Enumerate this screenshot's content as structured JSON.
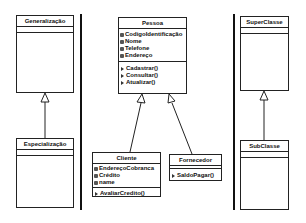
{
  "panels": {
    "left": {
      "parent": {
        "name": "Generalização",
        "attributes": [],
        "operations": []
      },
      "child": {
        "name": "Especialização",
        "attributes": [],
        "operations": []
      }
    },
    "center": {
      "parent": {
        "name": "Pessoa",
        "attributes": [
          "CodigoIdentificação",
          "Nome",
          "Telefone",
          "Endereço"
        ],
        "operations": [
          "Cadastrar()",
          "Consultar()",
          "Atualizar()"
        ]
      },
      "children": [
        {
          "name": "Cliente",
          "attributes": [
            "EndereçoCobranca",
            "Crédito",
            "name"
          ],
          "operations": [
            "AvaliarCredito()"
          ]
        },
        {
          "name": "Fornecedor",
          "attributes": [],
          "operations": [
            "SaldoPagar()"
          ]
        }
      ]
    },
    "right": {
      "parent": {
        "name": "SuperClasse",
        "attributes": [],
        "operations": []
      },
      "child": {
        "name": "SubClasse",
        "attributes": [],
        "operations": []
      }
    }
  },
  "relationship": "generalization",
  "colors": {
    "line": "#111111",
    "background": "#ffffff"
  }
}
